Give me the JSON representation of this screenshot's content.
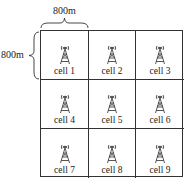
{
  "dimensions": {
    "width_label": "800m",
    "height_label": "800m"
  },
  "cells": [
    {
      "label": "cell 1",
      "icon": "cell-tower-icon"
    },
    {
      "label": "cell 2",
      "icon": "cell-tower-icon"
    },
    {
      "label": "cell 3",
      "icon": "cell-tower-icon"
    },
    {
      "label": "cell 4",
      "icon": "cell-tower-icon"
    },
    {
      "label": "cell 5",
      "icon": "cell-tower-icon"
    },
    {
      "label": "cell 6",
      "icon": "cell-tower-icon"
    },
    {
      "label": "cell 7",
      "icon": "cell-tower-icon"
    },
    {
      "label": "cell 8",
      "icon": "cell-tower-icon"
    },
    {
      "label": "cell 9",
      "icon": "cell-tower-icon"
    }
  ]
}
